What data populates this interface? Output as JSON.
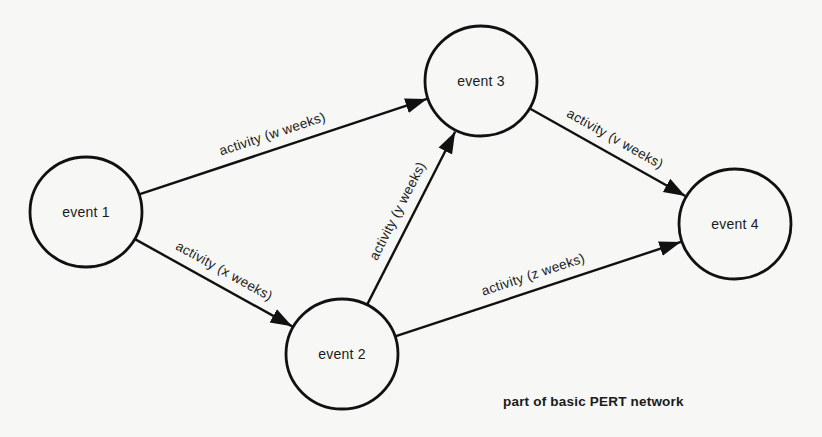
{
  "diagram": {
    "title": "part of basic PERT network",
    "style": {
      "stroke": "#111111",
      "background": "#f7f7f5"
    },
    "nodes": [
      {
        "id": "e1",
        "label": "event 1",
        "cx": 86,
        "cy": 212,
        "r": 56
      },
      {
        "id": "e2",
        "label": "event 2",
        "cx": 342,
        "cy": 354,
        "r": 56
      },
      {
        "id": "e3",
        "label": "event 3",
        "cx": 481,
        "cy": 81,
        "r": 56
      },
      {
        "id": "e4",
        "label": "event 4",
        "cx": 735,
        "cy": 224,
        "r": 56
      }
    ],
    "edges": [
      {
        "from": "e1",
        "to": "e3",
        "label": "activity (w weeks)",
        "label_t": 0.48,
        "offset": -11
      },
      {
        "from": "e1",
        "to": "e2",
        "label": "activity (x weeks)",
        "label_t": 0.52,
        "offset": -11
      },
      {
        "from": "e2",
        "to": "e3",
        "label": "activity (y weeks)",
        "label_t": 0.5,
        "offset": -11
      },
      {
        "from": "e3",
        "to": "e4",
        "label": "activity (v weeks)",
        "label_t": 0.5,
        "offset": -11
      },
      {
        "from": "e2",
        "to": "e4",
        "label": "activity (z weeks)",
        "label_t": 0.5,
        "offset": -11
      }
    ]
  },
  "caption": {
    "text": "part of basic PERT network",
    "x": 503,
    "y": 394
  }
}
